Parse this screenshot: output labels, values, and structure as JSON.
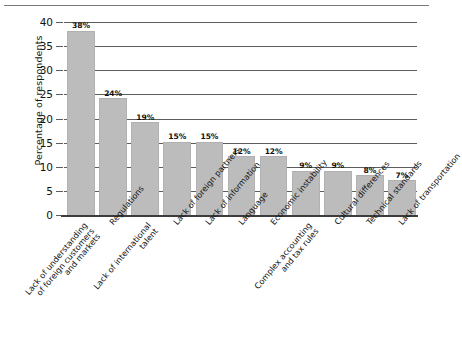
{
  "chart_data": {
    "type": "bar",
    "title": "",
    "subtitle": "",
    "xlabel": "",
    "ylabel": "Percentage of respondents",
    "ylim": [
      0,
      40
    ],
    "ytick_values": [
      0,
      5,
      10,
      15,
      20,
      25,
      30,
      35,
      40
    ],
    "ytick_labels": [
      "0",
      "5",
      "10",
      "15",
      "20",
      "25",
      "30",
      "35",
      "40"
    ],
    "grid": "horizontal",
    "legend": "none",
    "bar_color": "#bcbcbc",
    "categories": [
      "Lack of understanding of foreign customers and markets",
      "Regulations",
      "Lack of international talent",
      "Lack of foreign partners",
      "Lack of information",
      "Language",
      "Economic instability",
      "Complex accounting and tax rules",
      "Cultural differences",
      "Technical standards",
      "Lack of transportation"
    ],
    "category_lines": [
      [
        "Lack of understanding",
        "of foreign customers",
        "and markets"
      ],
      [
        "Regulations"
      ],
      [
        "Lack of international",
        "talent"
      ],
      [
        "Lack of foreign partners"
      ],
      [
        "Lack of information"
      ],
      [
        "Language"
      ],
      [
        "Economic instability"
      ],
      [
        "Complex accounting",
        "and tax rules"
      ],
      [
        "Cultural differences"
      ],
      [
        "Technical standards"
      ],
      [
        "Lack of transportation"
      ]
    ],
    "values": [
      38,
      24,
      19,
      15,
      15,
      12,
      12,
      9,
      9,
      8,
      7
    ],
    "value_labels": [
      "38%",
      "24%",
      "19%",
      "15%",
      "15%",
      "12%",
      "12%",
      "9%",
      "9%",
      "8%",
      "7%"
    ]
  }
}
